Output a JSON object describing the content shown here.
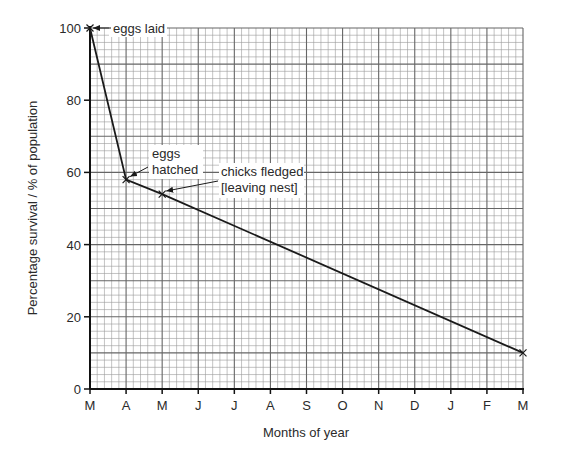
{
  "chart_data": {
    "type": "line",
    "title": "",
    "xlabel": "Months of year",
    "ylabel": "Percentage survival / % of population",
    "x_tick_labels": [
      "M",
      "A",
      "M",
      "J",
      "J",
      "A",
      "S",
      "O",
      "N",
      "D",
      "J",
      "F",
      "M"
    ],
    "y_tick_labels": [
      "0",
      "20",
      "40",
      "60",
      "80",
      "100"
    ],
    "y_ticks": [
      0,
      20,
      40,
      60,
      80,
      100
    ],
    "ylim": [
      0,
      100
    ],
    "xlim": [
      0,
      12
    ],
    "grid": true,
    "series": [
      {
        "name": "survival",
        "x": [
          0,
          1,
          2,
          12
        ],
        "x_labels": [
          "M",
          "A",
          "J",
          "M"
        ],
        "values": [
          100,
          58,
          54,
          10
        ]
      }
    ],
    "annotations": [
      {
        "text": "eggs laid",
        "x": 0,
        "y": 100
      },
      {
        "text": "eggs hatched",
        "lines": [
          "eggs",
          "hatched"
        ],
        "x": 1,
        "y": 58
      },
      {
        "text": "chicks fledged [leaving nest]",
        "lines": [
          "chicks fledged",
          "[leaving nest]"
        ],
        "x": 3,
        "y": 54
      }
    ]
  }
}
